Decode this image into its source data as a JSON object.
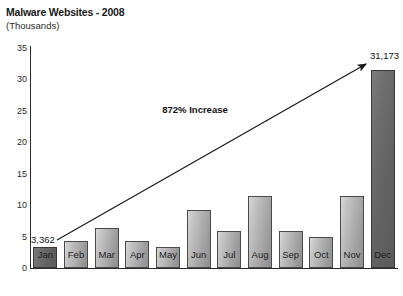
{
  "chart_data": {
    "type": "bar",
    "title": "Malware Websites - 2008",
    "subtitle": "(Thousands)",
    "xlabel": "",
    "ylabel": "(Thousands)",
    "ylim": [
      0,
      35
    ],
    "y_ticks": [
      "0",
      "5",
      "10",
      "15",
      "20",
      "25",
      "30",
      "35"
    ],
    "grid": false,
    "legend": "none",
    "categories": [
      "Jan",
      "Feb",
      "Mar",
      "Apr",
      "May",
      "Jun",
      "Jul",
      "Aug",
      "Sep",
      "Oct",
      "Nov",
      "Dec"
    ],
    "values": [
      3.362,
      4.3,
      6.3,
      4.2,
      3.3,
      9.1,
      5.8,
      11.4,
      5.8,
      4.9,
      11.4,
      31.173
    ],
    "annotations": [
      {
        "name": "increase-callout",
        "text": "872% Increase"
      },
      {
        "name": "first-value-label",
        "text": "3,362"
      },
      {
        "name": "last-value-label",
        "text": "31,173"
      }
    ],
    "series": [
      {
        "name": "Malware Websites",
        "values": [
          3.362,
          4.3,
          6.3,
          4.2,
          3.3,
          9.1,
          5.8,
          11.4,
          5.8,
          4.9,
          11.4,
          31.173
        ]
      }
    ]
  },
  "chart": {
    "title": "Malware Websites - 2008",
    "subtitle": "(Thousands)",
    "y_ticks": [
      "35",
      "30",
      "25",
      "20",
      "15",
      "10",
      "5",
      "0"
    ],
    "x_labels": [
      "Jan",
      "Feb",
      "Mar",
      "Apr",
      "May",
      "Jun",
      "Jul",
      "Aug",
      "Sep",
      "Oct",
      "Nov",
      "Dec"
    ],
    "first_value_label": "3,362",
    "last_value_label": "31,173",
    "annotation_label": "872% Increase",
    "colors": {
      "bar_light": "#ababab",
      "bar_dark": "#626262",
      "axis": "#2c2c2c",
      "text": "#111111",
      "background": "#ffffff"
    }
  }
}
